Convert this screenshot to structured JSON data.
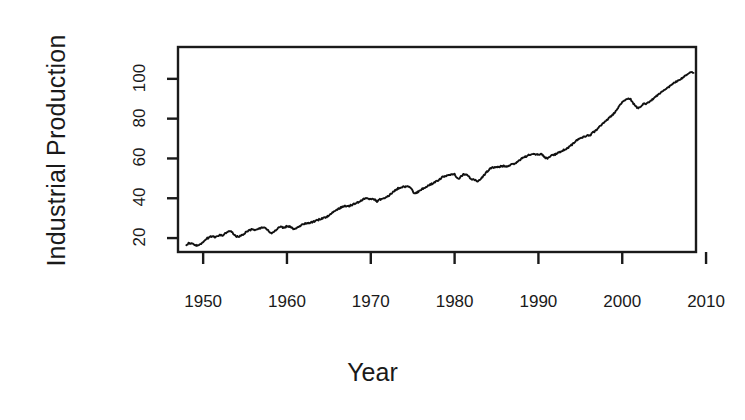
{
  "chart_data": {
    "type": "line",
    "title": "",
    "xlabel": "Year",
    "ylabel": "Industrial Production",
    "xlim": [
      1947.0,
      2008.8
    ],
    "ylim": [
      13,
      116
    ],
    "grid": false,
    "legend": null,
    "xticks": [
      1950,
      1960,
      1970,
      1980,
      1990,
      2000,
      2010
    ],
    "xtick_labels": [
      "1950",
      "1960",
      "1970",
      "1980",
      "1990",
      "2000",
      "2010"
    ],
    "yticks": [
      20,
      40,
      60,
      80,
      100
    ],
    "ytick_labels": [
      "20",
      "40",
      "60",
      "80",
      "100"
    ],
    "line_color": "#111111",
    "line_width": 1.8,
    "background": "#ffffff",
    "axis_color": "#1a1a1a",
    "series": [
      {
        "name": "Industrial Production",
        "x": [
          1948.0,
          1948.25,
          1948.5,
          1948.75,
          1949.0,
          1949.25,
          1949.5,
          1949.75,
          1950.0,
          1950.25,
          1950.5,
          1950.75,
          1951.0,
          1951.25,
          1951.5,
          1951.75,
          1952.0,
          1952.25,
          1952.5,
          1952.75,
          1953.0,
          1953.25,
          1953.5,
          1953.75,
          1954.0,
          1954.25,
          1954.5,
          1954.75,
          1955.0,
          1955.25,
          1955.5,
          1955.75,
          1956.0,
          1956.25,
          1956.5,
          1956.75,
          1957.0,
          1957.25,
          1957.5,
          1957.75,
          1958.0,
          1958.25,
          1958.5,
          1958.75,
          1959.0,
          1959.25,
          1959.5,
          1959.75,
          1960.0,
          1960.25,
          1960.5,
          1960.75,
          1961.0,
          1961.25,
          1961.5,
          1961.75,
          1962.0,
          1962.25,
          1962.5,
          1962.75,
          1963.0,
          1963.25,
          1963.5,
          1963.75,
          1964.0,
          1964.25,
          1964.5,
          1964.75,
          1965.0,
          1965.25,
          1965.5,
          1965.75,
          1966.0,
          1966.25,
          1966.5,
          1966.75,
          1967.0,
          1967.25,
          1967.5,
          1967.75,
          1968.0,
          1968.25,
          1968.5,
          1968.75,
          1969.0,
          1969.25,
          1969.5,
          1969.75,
          1970.0,
          1970.25,
          1970.5,
          1970.75,
          1971.0,
          1971.25,
          1971.5,
          1971.75,
          1972.0,
          1972.25,
          1972.5,
          1972.75,
          1973.0,
          1973.25,
          1973.5,
          1973.75,
          1974.0,
          1974.25,
          1974.5,
          1974.75,
          1975.0,
          1975.25,
          1975.5,
          1975.75,
          1976.0,
          1976.25,
          1976.5,
          1976.75,
          1977.0,
          1977.25,
          1977.5,
          1977.75,
          1978.0,
          1978.25,
          1978.5,
          1978.75,
          1979.0,
          1979.25,
          1979.5,
          1979.75,
          1980.0,
          1980.25,
          1980.5,
          1980.75,
          1981.0,
          1981.25,
          1981.5,
          1981.75,
          1982.0,
          1982.25,
          1982.5,
          1982.75,
          1983.0,
          1983.25,
          1983.5,
          1983.75,
          1984.0,
          1984.25,
          1984.5,
          1984.75,
          1985.0,
          1985.25,
          1985.5,
          1985.75,
          1986.0,
          1986.25,
          1986.5,
          1986.75,
          1987.0,
          1987.25,
          1987.5,
          1987.75,
          1988.0,
          1988.25,
          1988.5,
          1988.75,
          1989.0,
          1989.25,
          1989.5,
          1989.75,
          1990.0,
          1990.25,
          1990.5,
          1990.75,
          1991.0,
          1991.25,
          1991.5,
          1991.75,
          1992.0,
          1992.25,
          1992.5,
          1992.75,
          1993.0,
          1993.25,
          1993.5,
          1993.75,
          1994.0,
          1994.25,
          1994.5,
          1994.75,
          1995.0,
          1995.25,
          1995.5,
          1995.75,
          1996.0,
          1996.25,
          1996.5,
          1996.75,
          1997.0,
          1997.25,
          1997.5,
          1997.75,
          1998.0,
          1998.25,
          1998.5,
          1998.75,
          1999.0,
          1999.25,
          1999.5,
          1999.75,
          2000.0,
          2000.25,
          2000.5,
          2000.75,
          2001.0,
          2001.25,
          2001.5,
          2001.75,
          2002.0,
          2002.25,
          2002.5,
          2002.75,
          2003.0,
          2003.25,
          2003.5,
          2003.75,
          2004.0,
          2004.25,
          2004.5,
          2004.75,
          2005.0,
          2005.25,
          2005.5,
          2005.75,
          2006.0,
          2006.25,
          2006.5,
          2006.75,
          2007.0,
          2007.25,
          2007.5,
          2007.75,
          2008.0,
          2008.25,
          2008.5
        ],
        "y": [
          16.8,
          17.3,
          17.5,
          17.2,
          16.6,
          16.1,
          16.4,
          17.2,
          18.0,
          19.0,
          19.9,
          20.4,
          20.8,
          20.6,
          20.4,
          21.0,
          21.4,
          21.2,
          21.7,
          22.6,
          23.2,
          23.4,
          22.8,
          21.6,
          20.8,
          20.7,
          21.1,
          21.9,
          22.6,
          23.4,
          23.8,
          24.4,
          24.3,
          24.2,
          24.6,
          25.0,
          25.1,
          25.0,
          24.8,
          23.9,
          22.6,
          22.3,
          23.4,
          24.4,
          25.3,
          25.6,
          25.2,
          25.4,
          26.0,
          25.8,
          25.3,
          24.7,
          24.6,
          25.4,
          26.1,
          26.5,
          27.0,
          27.4,
          27.5,
          27.7,
          28.0,
          28.4,
          28.7,
          29.2,
          29.6,
          30.0,
          30.4,
          30.6,
          31.3,
          32.2,
          33.0,
          33.7,
          34.4,
          35.0,
          35.5,
          35.9,
          36.1,
          35.9,
          36.2,
          36.7,
          37.2,
          37.6,
          38.0,
          38.7,
          39.3,
          39.7,
          40.0,
          39.8,
          39.6,
          39.4,
          39.3,
          38.4,
          39.3,
          39.5,
          39.8,
          40.1,
          40.8,
          41.8,
          42.6,
          43.4,
          44.2,
          45.0,
          45.4,
          45.6,
          45.8,
          45.6,
          45.9,
          45.2,
          43.6,
          42.2,
          42.8,
          43.6,
          44.4,
          45.0,
          45.3,
          46.0,
          46.6,
          47.2,
          47.8,
          48.2,
          48.8,
          49.6,
          50.4,
          51.0,
          51.4,
          51.5,
          51.8,
          52.1,
          52.0,
          50.6,
          49.8,
          51.0,
          51.8,
          52.2,
          51.8,
          50.6,
          49.8,
          49.4,
          49.0,
          48.6,
          49.2,
          50.4,
          51.6,
          52.8,
          54.0,
          55.0,
          55.4,
          55.4,
          55.6,
          55.8,
          56.0,
          56.2,
          56.2,
          56.0,
          56.4,
          56.8,
          57.0,
          57.6,
          58.4,
          59.2,
          59.9,
          60.5,
          61.0,
          61.6,
          62.0,
          62.2,
          62.0,
          61.8,
          62.0,
          62.2,
          61.8,
          60.6,
          59.9,
          60.4,
          61.4,
          61.8,
          62.0,
          62.6,
          63.0,
          63.6,
          64.2,
          64.6,
          65.2,
          66.0,
          67.0,
          68.0,
          68.8,
          69.6,
          70.2,
          70.6,
          71.0,
          71.6,
          71.4,
          72.0,
          73.0,
          73.8,
          74.6,
          75.8,
          76.8,
          77.8,
          78.6,
          79.6,
          80.6,
          81.6,
          82.6,
          84.0,
          85.4,
          86.8,
          88.0,
          89.2,
          90.0,
          90.4,
          89.8,
          88.0,
          86.6,
          85.6,
          85.4,
          86.4,
          87.2,
          87.4,
          87.8,
          88.4,
          89.2,
          90.0,
          91.0,
          92.0,
          92.8,
          93.6,
          94.2,
          95.0,
          95.6,
          96.6,
          97.4,
          98.2,
          98.6,
          99.2,
          100.0,
          100.8,
          101.6,
          102.2,
          102.8,
          103.2,
          103.0
        ]
      }
    ],
    "annotations": []
  },
  "axis_titles": {
    "y": "Industrial Production",
    "x": "Year"
  }
}
